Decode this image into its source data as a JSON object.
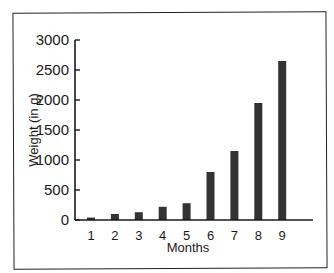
{
  "chart_data": {
    "type": "bar",
    "title": "",
    "xlabel": "Months",
    "ylabel": "Weight (in g)",
    "categories": [
      "1",
      "2",
      "3",
      "4",
      "5",
      "6",
      "7",
      "8",
      "9"
    ],
    "values": [
      40,
      100,
      130,
      220,
      280,
      800,
      1150,
      1950,
      2650
    ],
    "ylim": [
      0,
      3000
    ],
    "yticks": [
      0,
      500,
      1000,
      1500,
      2000,
      2500,
      3000
    ],
    "grid": false,
    "legend": null,
    "bar_color": "#333333"
  }
}
